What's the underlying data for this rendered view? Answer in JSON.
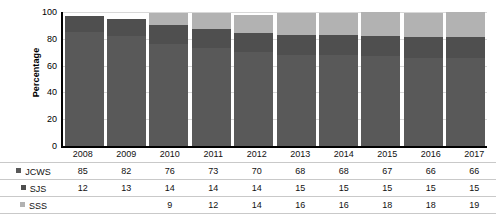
{
  "chart_data": {
    "type": "bar",
    "subtype": "stacked-column-100",
    "title": "",
    "xlabel": "",
    "ylabel": "Percentage",
    "ylim": [
      0,
      100
    ],
    "ytick_values": [
      0,
      20,
      40,
      60,
      80,
      100
    ],
    "ytick_labels": [
      "0",
      "20",
      "40",
      "60",
      "80",
      "100"
    ],
    "grid": true,
    "legend_position": "table-left",
    "categories": [
      "2008",
      "2009",
      "2010",
      "2011",
      "2012",
      "2013",
      "2014",
      "2015",
      "2016",
      "2017"
    ],
    "series": [
      {
        "name": "JCWS",
        "color": "#595959",
        "values": [
          85,
          82,
          76,
          73,
          70,
          68,
          68,
          67,
          66,
          66
        ],
        "labels": [
          "85",
          "82",
          "76",
          "73",
          "70",
          "68",
          "68",
          "67",
          "66",
          "66"
        ]
      },
      {
        "name": "SJS",
        "color": "#4f4f4f",
        "values": [
          12,
          13,
          14,
          14,
          14,
          15,
          15,
          15,
          15,
          15
        ],
        "labels": [
          "12",
          "13",
          "14",
          "14",
          "14",
          "15",
          "15",
          "15",
          "15",
          "15"
        ]
      },
      {
        "name": "SSS",
        "color": "#b2b2b2",
        "values": [
          0,
          0,
          9,
          12,
          14,
          16,
          16,
          18,
          18,
          19
        ],
        "labels": [
          "",
          "",
          "9",
          "12",
          "14",
          "16",
          "16",
          "18",
          "18",
          "19"
        ]
      }
    ]
  },
  "axis": {
    "y_title": "Percentage",
    "y_ticks": [
      "100",
      "80",
      "60",
      "40",
      "20",
      "0"
    ]
  },
  "table": {
    "years": [
      "2008",
      "2009",
      "2010",
      "2011",
      "2012",
      "2013",
      "2014",
      "2015",
      "2016",
      "2017"
    ],
    "rows": [
      {
        "label": "JCWS",
        "swatch_name": "legend-swatch-jcws",
        "values": [
          "85",
          "82",
          "76",
          "73",
          "70",
          "68",
          "68",
          "67",
          "66",
          "66"
        ]
      },
      {
        "label": "SJS",
        "swatch_name": "legend-swatch-sjs",
        "values": [
          "12",
          "13",
          "14",
          "14",
          "14",
          "15",
          "15",
          "15",
          "15",
          "15"
        ]
      },
      {
        "label": "SSS",
        "swatch_name": "legend-swatch-sss",
        "values": [
          "",
          "",
          "9",
          "12",
          "14",
          "16",
          "16",
          "18",
          "18",
          "19"
        ]
      }
    ]
  },
  "colors": {
    "jcws": "#595959",
    "sjs": "#4f4f4f",
    "sss": "#b2b2b2",
    "axis": "#000000",
    "gridline": "#d8d8d8",
    "table_rule": "#c9c9c9"
  }
}
